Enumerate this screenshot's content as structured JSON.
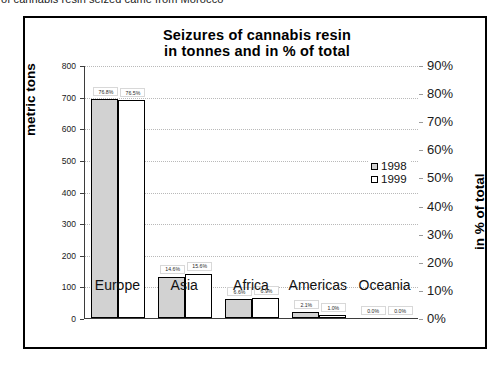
{
  "caption": {
    "text": "of cannabis resin seized came from Morocco"
  },
  "chart_data": {
    "type": "bar",
    "title": "Seizures of cannabis resin in tonnes and in % of total",
    "title_line1": "Seizures of cannabis resin",
    "title_line2": "in tonnes and in % of total",
    "categories": [
      "Europe",
      "Asia",
      "Africa",
      "Americas",
      "Oceania"
    ],
    "xlabel": "",
    "ylabel": "metric tons",
    "ylabel_secondary": "in % of total",
    "ylim": [
      0,
      800
    ],
    "ylim_secondary": [
      0,
      90
    ],
    "yticks": [
      "0",
      "100",
      "200",
      "300",
      "400",
      "500",
      "600",
      "700",
      "800"
    ],
    "yticks_secondary": [
      "0%",
      "10%",
      "20%",
      "30%",
      "40%",
      "50%",
      "60%",
      "70%",
      "80%",
      "90%"
    ],
    "grid": true,
    "legend_position": "center-right",
    "series": [
      {
        "name": "1998",
        "color": "#d2d2d2",
        "values": [
          691,
          131,
          59,
          19,
          0
        ],
        "labels": [
          "76.8%",
          "14.6%",
          "6.6%",
          "2.1%",
          "0.0%"
        ]
      },
      {
        "name": "1999",
        "color": "#ffffff",
        "values": [
          688,
          140,
          62,
          9,
          0
        ],
        "labels": [
          "76.5%",
          "15.6%",
          "6.9%",
          "1.0%",
          "0.0%"
        ]
      }
    ]
  }
}
